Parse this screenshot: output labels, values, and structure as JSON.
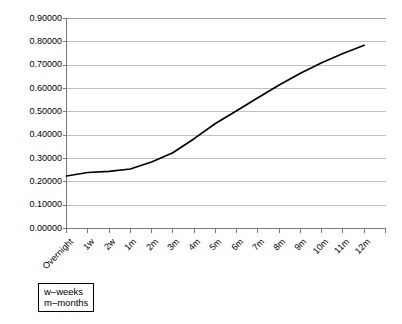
{
  "chart_data": {
    "type": "line",
    "title": "",
    "xlabel": "",
    "ylabel": "",
    "categories": [
      "Overnight",
      "1w",
      "2w",
      "1m",
      "2m",
      "3m",
      "4m",
      "5m",
      "6m",
      "7m",
      "8m",
      "9m",
      "10m",
      "11m",
      "12m"
    ],
    "values": [
      0.225,
      0.24,
      0.245,
      0.255,
      0.285,
      0.325,
      0.385,
      0.45,
      0.505,
      0.56,
      0.615,
      0.665,
      0.71,
      0.75,
      0.785
    ],
    "series": [
      {
        "name": "rate",
        "values": [
          0.225,
          0.24,
          0.245,
          0.255,
          0.285,
          0.325,
          0.385,
          0.45,
          0.505,
          0.56,
          0.615,
          0.665,
          0.71,
          0.75,
          0.785
        ]
      }
    ],
    "ylim": [
      0.0,
      0.9
    ],
    "ytick_values": [
      0.0,
      0.1,
      0.2,
      0.3,
      0.4,
      0.5,
      0.6,
      0.7,
      0.8,
      0.9
    ],
    "ytick_labels": [
      "0.00000",
      "0.10000",
      "0.20000",
      "0.30000",
      "0.40000",
      "0.50000",
      "0.60000",
      "0.70000",
      "0.80000",
      "0.90000"
    ],
    "grid": "horizontal",
    "legend_position": "below-left",
    "line_color": "#000000",
    "grid_color": "#c0c0c0",
    "axis_color": "#808080",
    "background_color": "#ffffff"
  },
  "legend": {
    "lines": [
      "w–weeks",
      "m–months"
    ]
  }
}
